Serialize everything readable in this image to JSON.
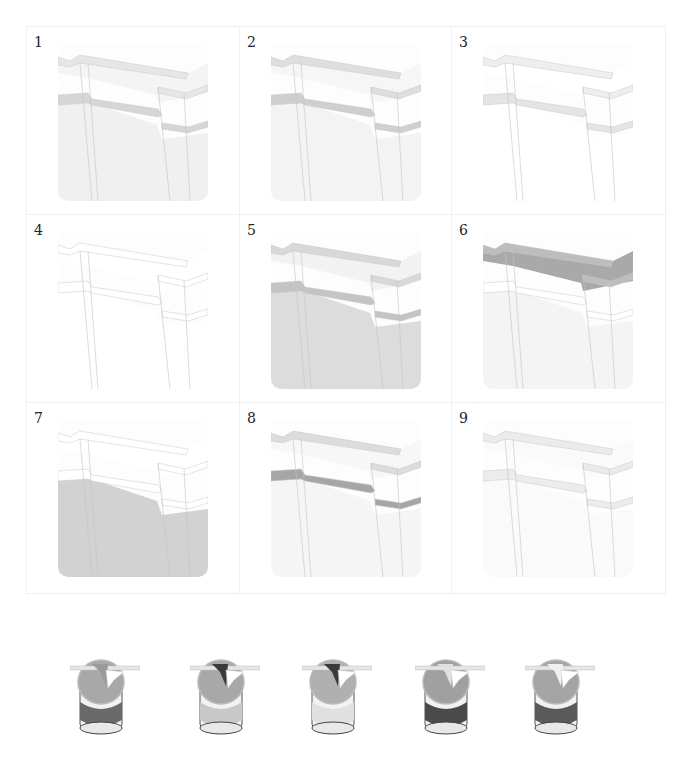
{
  "figure": {
    "panels": [
      {
        "number": "1",
        "wall": "#f0f0f0",
        "band": "#d6d6d6",
        "top": "#f4f4f4",
        "cornice": "#e6e6e6"
      },
      {
        "number": "2",
        "wall": "#f3f3f3",
        "band": "#cfcfcf",
        "top": "#f6f6f6",
        "cornice": "#dedede"
      },
      {
        "number": "3",
        "wall": "#ffffff",
        "band": "#e4e4e4",
        "top": "#ffffff",
        "cornice": "#eeeeee"
      },
      {
        "number": "4",
        "wall": "#ffffff",
        "band": "#ffffff",
        "top": "#ffffff",
        "cornice": "#ffffff"
      },
      {
        "number": "5",
        "wall": "#dcdcdc",
        "band": "#c4c4c4",
        "top": "#f2f2f2",
        "cornice": "#d8d8d8"
      },
      {
        "number": "6",
        "wall": "#f4f4f4",
        "band": "#ffffff",
        "top": "#a9a9a9",
        "cornice": "#bdbdbd"
      },
      {
        "number": "7",
        "wall": "#d2d2d2",
        "band": "#ffffff",
        "top": "#ffffff",
        "cornice": "#ffffff"
      },
      {
        "number": "8",
        "wall": "#f5f5f5",
        "band": "#a6a6a6",
        "top": "#f7f7f7",
        "cornice": "#dcdcdc"
      },
      {
        "number": "9",
        "wall": "#fafafa",
        "band": "#ececec",
        "top": "#fafafa",
        "cornice": "#ebebeb"
      }
    ],
    "paint_cans": [
      {
        "label": "paint-can-1",
        "band": "#6a6a6a",
        "lid": "#a8a8a8",
        "brush": "#9a9a9a"
      },
      {
        "label": "paint-can-2",
        "band": "#c8c8c8",
        "lid": "#a8a8a8",
        "brush": "#3a3a3a"
      },
      {
        "label": "paint-can-3",
        "band": "#e0e0e0",
        "lid": "#b0b0b0",
        "brush": "#3a3a3a"
      },
      {
        "label": "paint-can-4",
        "band": "#4a4a4a",
        "lid": "#a0a0a0",
        "brush": "#e0e0e0"
      },
      {
        "label": "paint-can-5",
        "band": "#5a5a5a",
        "lid": "#a4a4a4",
        "brush": "#f0f0f0"
      }
    ]
  }
}
